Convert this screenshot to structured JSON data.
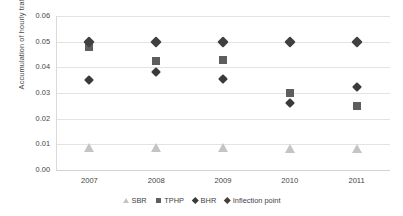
{
  "chart_data": {
    "type": "scatter",
    "title": "",
    "xlabel": "",
    "ylabel": "Accumulation of hourly traffic",
    "categories": [
      "2007",
      "2008",
      "2009",
      "2010",
      "2011"
    ],
    "x_tick_labels": [
      "2007",
      "2008",
      "2009",
      "2010",
      "2011"
    ],
    "y_tick_labels": [
      "0.00",
      "0.01",
      "0.02",
      "0.03",
      "0.04",
      "0.05",
      "0.06"
    ],
    "y_tick_values": [
      0.0,
      0.01,
      0.02,
      0.03,
      0.04,
      0.05,
      0.06
    ],
    "ylim": [
      0.0,
      0.06
    ],
    "grid": "horizontal",
    "legend_position": "bottom",
    "series": [
      {
        "name": "SBR",
        "marker": "triangle",
        "color": "#c4c4c4",
        "values": [
          0.0085,
          0.0085,
          0.0085,
          0.008,
          0.008
        ]
      },
      {
        "name": "TPHP",
        "marker": "square",
        "color": "#5e5e5e",
        "values": [
          0.048,
          0.0425,
          0.0428,
          0.03,
          0.025
        ]
      },
      {
        "name": "BHR",
        "marker": "diamond",
        "color": "#3a3a3a",
        "values": [
          0.035,
          0.038,
          0.0355,
          0.026,
          0.0325
        ]
      },
      {
        "name": "Inflection point",
        "marker": "diamond",
        "color": "#404040",
        "values": [
          0.05,
          0.05,
          0.05,
          0.05,
          0.05
        ]
      }
    ]
  },
  "legend": {
    "items": [
      {
        "label": "SBR"
      },
      {
        "label": "TPHP"
      },
      {
        "label": "BHR"
      },
      {
        "label": "Inflection point"
      }
    ]
  }
}
